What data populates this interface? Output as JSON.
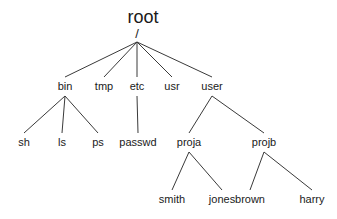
{
  "diagram": {
    "type": "tree",
    "root": {
      "id": "root",
      "label": "root",
      "separator": "/"
    },
    "nodes": [
      {
        "id": "bin",
        "label": "bin",
        "parent": "root"
      },
      {
        "id": "tmp",
        "label": "tmp",
        "parent": "root"
      },
      {
        "id": "etc",
        "label": "etc",
        "parent": "root"
      },
      {
        "id": "usr",
        "label": "usr",
        "parent": "root"
      },
      {
        "id": "user",
        "label": "user",
        "parent": "root"
      },
      {
        "id": "sh",
        "label": "sh",
        "parent": "bin"
      },
      {
        "id": "ls",
        "label": "ls",
        "parent": "bin"
      },
      {
        "id": "ps",
        "label": "ps",
        "parent": "bin"
      },
      {
        "id": "passwd",
        "label": "passwd",
        "parent": "etc"
      },
      {
        "id": "proja",
        "label": "proja",
        "parent": "user"
      },
      {
        "id": "projb",
        "label": "projb",
        "parent": "user"
      },
      {
        "id": "smith",
        "label": "smith",
        "parent": "proja"
      },
      {
        "id": "jones",
        "label": "jones",
        "parent": "proja"
      },
      {
        "id": "brown",
        "label": "brown",
        "parent": "projb"
      },
      {
        "id": "harry",
        "label": "harry",
        "parent": "projb"
      }
    ],
    "colors": {
      "line": "#3a3a3a",
      "text": "#1a1a1a",
      "background": "#ffffff"
    }
  }
}
